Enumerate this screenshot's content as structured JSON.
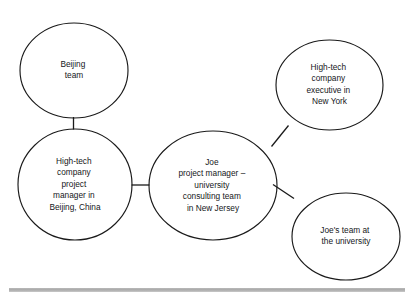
{
  "diagram": {
    "type": "node-link-network",
    "background_color": "#ffffff",
    "stroke_color": "#1a1a1a",
    "nodes": [
      {
        "id": "beijing-team",
        "name": "Beijing team",
        "shape": "circle",
        "lines": [
          "Beijing",
          "team"
        ],
        "cx": 74,
        "cy": 70.5,
        "rx": 54,
        "ry": 47.5
      },
      {
        "id": "beijing-project-manager",
        "name": "High-tech company project manager in Beijing, China",
        "shape": "ellipse",
        "lines": [
          "High-tech",
          "company",
          "project",
          "manager in",
          "Beijing, China"
        ],
        "cx": 75,
        "cy": 184.5,
        "rx": 57,
        "ry": 55.5
      },
      {
        "id": "joe-project-manager",
        "name": "Joe project manager - university consulting team in New Jersey",
        "shape": "ellipse",
        "lines": [
          "Joe",
          "project manager –",
          "university",
          "consulting team",
          "in New Jersey"
        ],
        "cx": 213,
        "cy": 185.5,
        "rx": 64,
        "ry": 54.5
      },
      {
        "id": "new-york-executive",
        "name": "High-tech company executive in New York",
        "shape": "ellipse",
        "lines": [
          "High-tech",
          "company",
          "executive in",
          "New York"
        ],
        "cx": 329.5,
        "cy": 85,
        "rx": 53.5,
        "ry": 45
      },
      {
        "id": "joes-university-team",
        "name": "Joe's team at the university",
        "shape": "ellipse",
        "lines": [
          "Joe's team at",
          "the university"
        ],
        "cx": 346,
        "cy": 236.5,
        "rx": 54,
        "ry": 43.5
      }
    ],
    "edges": [
      {
        "id": "edge-beijing-team-to-beijing-pm",
        "from": "beijing-team",
        "to": "beijing-project-manager",
        "orientation": "vertical",
        "x1": 73.5,
        "y1": 117,
        "x2": 73.5,
        "y2": 129.5
      },
      {
        "id": "edge-beijing-pm-to-joe",
        "from": "beijing-project-manager",
        "to": "joe-project-manager",
        "orientation": "horizontal",
        "x1": 131.5,
        "y1": 185,
        "x2": 149.5,
        "y2": 185
      },
      {
        "id": "edge-joe-to-new-york-executive",
        "from": "joe-project-manager",
        "to": "new-york-executive",
        "orientation": "diagonal",
        "x1": 271.5,
        "y1": 146.5,
        "x2": 288.5,
        "y2": 125.5
      },
      {
        "id": "edge-joe-to-joes-university-team",
        "from": "joe-project-manager",
        "to": "joes-university-team",
        "orientation": "diagonal",
        "x1": 273,
        "y1": 184.5,
        "x2": 294,
        "y2": 198.5
      }
    ],
    "footer_rule": {
      "name": "footer-divider",
      "color": "#b0b0b0",
      "x": 9,
      "y": 288,
      "width": 396,
      "height": 4
    }
  }
}
